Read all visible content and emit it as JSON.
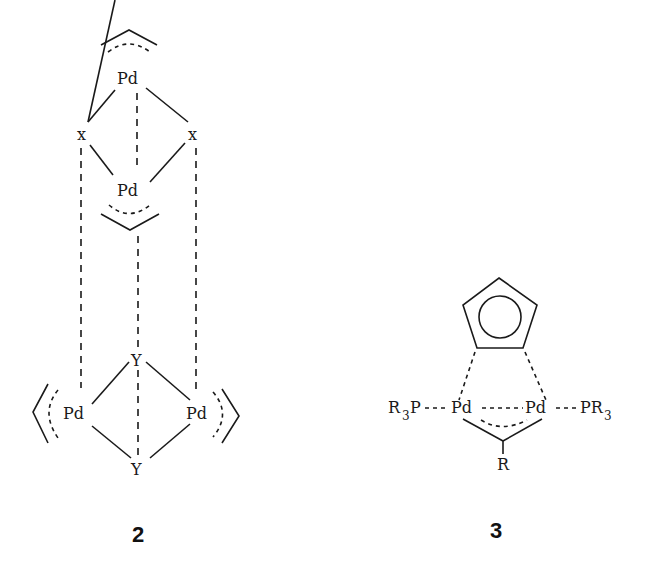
{
  "figure": {
    "structure_2": {
      "label": "2",
      "atoms": {
        "pd_top": "Pd",
        "x_left": "x",
        "x_right": "x",
        "pd_mid": "Pd",
        "y_top": "Y",
        "pd_left": "Pd",
        "pd_right": "Pd",
        "y_bottom": "Y"
      }
    },
    "structure_3": {
      "label": "3",
      "atoms": {
        "r3p": "R",
        "r3p_sub": "3",
        "r3p_p": "P",
        "pd_left": "Pd",
        "pd_right": "Pd",
        "pr3_p": "PR",
        "pr3_sub": "3",
        "r_bottom": "R"
      }
    }
  }
}
